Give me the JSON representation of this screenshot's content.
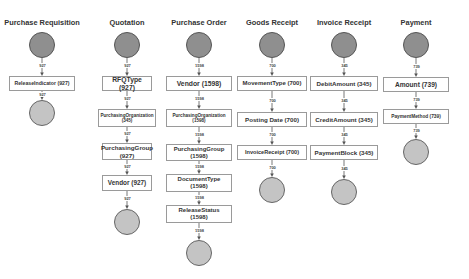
{
  "diagram": {
    "type": "process-flow-lanes",
    "colors": {
      "start_node": "#8f8f8f",
      "end_node": "#c4c4c4",
      "box_border": "#9a9a9a",
      "edge": "#555555"
    },
    "lanes": [
      {
        "title": "Purchase Requisition",
        "cx": 42,
        "start": {
          "cy": 45,
          "r": 13
        },
        "steps": [
          {
            "label": "ReleaseIndicator (927)",
            "y": 76,
            "h": 15,
            "w": 66,
            "fs": 5.2,
            "in": "927"
          }
        ],
        "end": {
          "cy": 113,
          "r": 13,
          "in": "927"
        }
      },
      {
        "title": "Quotation",
        "cx": 127,
        "start": {
          "cy": 45,
          "r": 13
        },
        "steps": [
          {
            "label": "RFQType (927)",
            "y": 76,
            "h": 15,
            "w": 50,
            "fs": 6.8,
            "in": "927"
          },
          {
            "label": "PurchasingOrganization (345)",
            "y": 109,
            "h": 18,
            "w": 58,
            "fs": 4.6,
            "in": "927"
          },
          {
            "label": "PurchasingGroup (927)",
            "y": 143,
            "h": 17,
            "w": 50,
            "fs": 6.2,
            "in": "927"
          },
          {
            "label": "Vendor (927)",
            "y": 175,
            "h": 16,
            "w": 50,
            "fs": 6.4,
            "in": "927"
          }
        ],
        "end": {
          "cy": 222,
          "r": 13,
          "in": "927"
        }
      },
      {
        "title": "Purchase Order",
        "cx": 199,
        "start": {
          "cy": 45,
          "r": 13
        },
        "steps": [
          {
            "label": "Vendor (1598)",
            "y": 76,
            "h": 15,
            "w": 66,
            "fs": 6.8,
            "in": "1598"
          },
          {
            "label": "PurchasingOrganization (1598)",
            "y": 109,
            "h": 18,
            "w": 66,
            "fs": 4.6,
            "in": "1598"
          },
          {
            "label": "PurchasingGroup (1598)",
            "y": 144,
            "h": 17,
            "w": 66,
            "fs": 6,
            "in": "1598"
          },
          {
            "label": "DocumentType (1598)",
            "y": 174,
            "h": 18,
            "w": 66,
            "fs": 6,
            "in": "1598"
          },
          {
            "label": "ReleaseStatus (1598)",
            "y": 205,
            "h": 18,
            "w": 66,
            "fs": 6,
            "in": "1598"
          }
        ],
        "end": {
          "cy": 253,
          "r": 13,
          "in": "1598"
        }
      },
      {
        "title": "Goods Receipt",
        "cx": 272,
        "start": {
          "cy": 45,
          "r": 13
        },
        "steps": [
          {
            "label": "MovementType (700)",
            "y": 76,
            "h": 15,
            "w": 70,
            "fs": 6,
            "in": "700"
          },
          {
            "label": "Posting Date (700)",
            "y": 112,
            "h": 15,
            "w": 70,
            "fs": 6.2,
            "in": "700"
          },
          {
            "label": "InvoiceReceipt (700)",
            "y": 145,
            "h": 15,
            "w": 70,
            "fs": 5.6,
            "in": "700"
          }
        ],
        "end": {
          "cy": 190,
          "r": 13,
          "in": "700"
        }
      },
      {
        "title": "Invoice Receipt",
        "cx": 344,
        "start": {
          "cy": 45,
          "r": 13
        },
        "steps": [
          {
            "label": "DebitAmount (345)",
            "y": 76,
            "h": 15,
            "w": 68,
            "fs": 6.2,
            "in": "345"
          },
          {
            "label": "CreditAmount (345)",
            "y": 112,
            "h": 15,
            "w": 68,
            "fs": 6.2,
            "in": "345"
          },
          {
            "label": "PaymentBlock (345)",
            "y": 145,
            "h": 15,
            "w": 68,
            "fs": 6.2,
            "in": "345"
          }
        ],
        "end": {
          "cy": 192,
          "r": 13,
          "in": "345"
        }
      },
      {
        "title": "Payment",
        "cx": 416,
        "start": {
          "cy": 45,
          "r": 13
        },
        "steps": [
          {
            "label": "Amount (739)",
            "y": 77,
            "h": 15,
            "w": 66,
            "fs": 6.6,
            "in": "739"
          },
          {
            "label": "PaymentMethod (739)",
            "y": 109,
            "h": 15,
            "w": 66,
            "fs": 4.8,
            "in": "739"
          }
        ],
        "end": {
          "cy": 152,
          "r": 13,
          "in": "739"
        }
      }
    ]
  }
}
